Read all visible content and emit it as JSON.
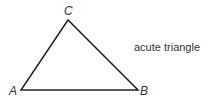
{
  "figure": {
    "caption": "acute triangle",
    "stroke_color": "#222222",
    "vertices": [
      {
        "label": "A",
        "x": 21,
        "y": 90
      },
      {
        "label": "B",
        "x": 138,
        "y": 90
      },
      {
        "label": "C",
        "x": 68,
        "y": 20
      }
    ]
  }
}
